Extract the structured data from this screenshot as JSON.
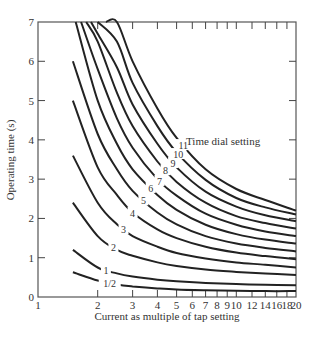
{
  "chart_data": {
    "type": "line",
    "title": "",
    "xlabel": "Current as multiple of tap setting",
    "ylabel": "Operating time (s)",
    "xscale": "log",
    "xlim": [
      1,
      20
    ],
    "ylim": [
      0,
      7
    ],
    "xticks": [
      1,
      2,
      3,
      4,
      5,
      6,
      7,
      8,
      9,
      10,
      12,
      14,
      16,
      18,
      20
    ],
    "xtick_labels": [
      "1",
      "2",
      "3",
      "4",
      "5",
      "6",
      "7",
      "8",
      "9",
      "10",
      "12",
      "14",
      "16",
      "18",
      "20"
    ],
    "yticks": [
      0,
      1,
      2,
      3,
      4,
      5,
      6,
      7
    ],
    "ytick_labels": [
      "0",
      "1",
      "2",
      "3",
      "4",
      "5",
      "6",
      "7"
    ],
    "grid": false,
    "annotation": "Time dial setting",
    "series": [
      {
        "name": "1/2",
        "x": [
          1.5,
          2,
          2.5,
          3,
          4,
          5,
          7,
          10,
          14,
          20
        ],
        "y": [
          0.63,
          0.42,
          0.32,
          0.27,
          0.22,
          0.19,
          0.17,
          0.16,
          0.15,
          0.15
        ],
        "label_at": 2.3
      },
      {
        "name": "1",
        "x": [
          1.5,
          2,
          2.5,
          3,
          4,
          5,
          7,
          10,
          14,
          20
        ],
        "y": [
          1.2,
          0.75,
          0.6,
          0.52,
          0.44,
          0.4,
          0.36,
          0.33,
          0.31,
          0.3
        ],
        "label_at": 2.2
      },
      {
        "name": "2",
        "x": [
          1.5,
          2,
          2.5,
          3,
          4,
          5,
          7,
          10,
          14,
          20
        ],
        "y": [
          2.4,
          1.55,
          1.2,
          1.05,
          0.88,
          0.79,
          0.7,
          0.64,
          0.6,
          0.56
        ],
        "label_at": 2.4
      },
      {
        "name": "3",
        "x": [
          1.5,
          2,
          2.5,
          3,
          4,
          5,
          7,
          10,
          14,
          20
        ],
        "y": [
          3.6,
          2.4,
          1.85,
          1.55,
          1.28,
          1.12,
          0.98,
          0.88,
          0.82,
          0.75
        ],
        "label_at": 2.7
      },
      {
        "name": "4",
        "x": [
          1.5,
          2,
          2.5,
          3,
          4,
          5,
          7,
          10,
          14,
          20
        ],
        "y": [
          5.0,
          3.3,
          2.6,
          2.15,
          1.72,
          1.5,
          1.28,
          1.13,
          1.04,
          0.96
        ],
        "label_at": 3.0
      },
      {
        "name": "5",
        "x": [
          1.5,
          2,
          2.5,
          3,
          4,
          5,
          7,
          10,
          14,
          20
        ],
        "y": [
          6.0,
          4.15,
          3.25,
          2.7,
          2.15,
          1.85,
          1.55,
          1.36,
          1.25,
          1.16
        ],
        "label_at": 3.4
      },
      {
        "name": "6",
        "x": [
          1.55,
          2,
          2.5,
          3,
          4,
          5,
          7,
          10,
          14,
          20
        ],
        "y": [
          7.0,
          5.0,
          3.9,
          3.25,
          2.6,
          2.22,
          1.84,
          1.6,
          1.46,
          1.36
        ],
        "label_at": 3.7
      },
      {
        "name": "7",
        "x": [
          1.65,
          2,
          2.5,
          3,
          4,
          5,
          7,
          10,
          14,
          20
        ],
        "y": [
          7.0,
          5.8,
          4.55,
          3.8,
          3.0,
          2.58,
          2.12,
          1.84,
          1.67,
          1.55
        ],
        "label_at": 4.1
      },
      {
        "name": "8",
        "x": [
          1.75,
          2,
          2.5,
          3,
          4,
          5,
          7,
          10,
          14,
          20
        ],
        "y": [
          7.0,
          6.5,
          5.2,
          4.35,
          3.45,
          2.93,
          2.4,
          2.06,
          1.88,
          1.74
        ],
        "label_at": 4.4
      },
      {
        "name": "9",
        "x": [
          1.85,
          2,
          2.5,
          3,
          4,
          5,
          7,
          10,
          14,
          20
        ],
        "y": [
          7.0,
          6.7,
          5.85,
          4.9,
          3.9,
          3.3,
          2.68,
          2.3,
          2.08,
          1.93
        ],
        "label_at": 4.8
      },
      {
        "name": "10",
        "x": [
          2.0,
          2.5,
          3,
          4,
          5,
          7,
          10,
          14,
          20
        ],
        "y": [
          7.0,
          6.5,
          5.45,
          4.35,
          3.68,
          2.98,
          2.52,
          2.28,
          2.1
        ],
        "label_at": 5.1
      },
      {
        "name": "11",
        "x": [
          2.2,
          2.5,
          3,
          4,
          5,
          7,
          10,
          14,
          20
        ],
        "y": [
          7.0,
          7.0,
          6.0,
          4.8,
          4.05,
          3.25,
          2.75,
          2.47,
          2.2
        ],
        "label_at": 5.4
      }
    ]
  }
}
